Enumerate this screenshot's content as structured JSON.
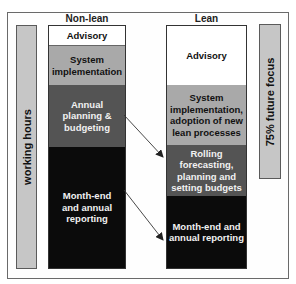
{
  "diagram": {
    "type": "stacked-comparison",
    "left_axis_label": "working hours",
    "right_axis_label": "75% future focus",
    "columns": [
      {
        "title": "Non-lean",
        "segments": [
          {
            "label": "Advisory",
            "shade": "white"
          },
          {
            "label": "System implementation",
            "shade": "light"
          },
          {
            "label": "Annual planning & budgeting",
            "shade": "dark"
          },
          {
            "label": "Month-end and annual reporting",
            "shade": "black"
          }
        ]
      },
      {
        "title": "Lean",
        "segments": [
          {
            "label": "Advisory",
            "shade": "white"
          },
          {
            "label": "System implementation, adoption of new lean processes",
            "shade": "light"
          },
          {
            "label": "Rolling forecasting, planning and setting budgets",
            "shade": "dark"
          },
          {
            "label": "Month-end and annual reporting",
            "shade": "black"
          }
        ]
      }
    ],
    "arrows": [
      {
        "from": "Annual planning & budgeting",
        "to": "Rolling forecasting, planning and setting budgets"
      },
      {
        "from": "Month-end and annual reporting",
        "to": "Month-end and annual reporting"
      }
    ],
    "colors": {
      "white": "#ffffff",
      "light": "#a9a9a9",
      "dark": "#545454",
      "black": "#0b0b0b",
      "side_bar": "#c6c6c6"
    }
  }
}
